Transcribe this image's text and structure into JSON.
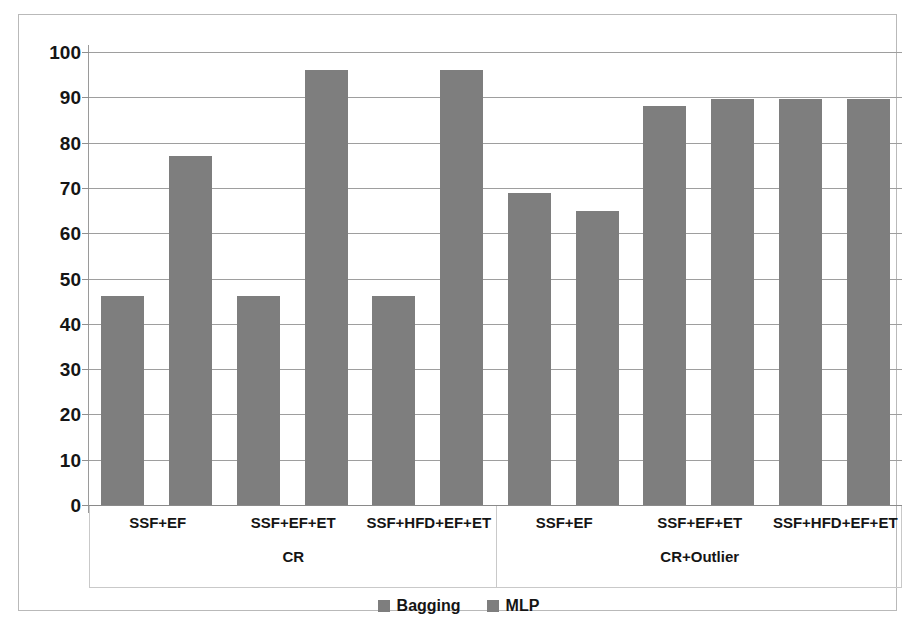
{
  "chart_data": {
    "type": "bar",
    "title": "",
    "xlabel": "",
    "ylabel": "",
    "ylim": [
      0,
      100
    ],
    "yticks": [
      0,
      10,
      20,
      30,
      40,
      50,
      60,
      70,
      80,
      90,
      100
    ],
    "grid": true,
    "legend_position": "bottom",
    "categories": [
      "SSF+EF",
      "SSF+EF+ET",
      "SSF+HFD+EF+ET"
    ],
    "groups": [
      "CR",
      "CR+Outlier"
    ],
    "series": [
      {
        "name": "Bagging",
        "color": "#7e7e7e"
      },
      {
        "name": "MLP",
        "color": "#7e7e7e"
      }
    ],
    "bars": [
      {
        "group": "CR",
        "category": "SSF+EF",
        "series": "Bagging",
        "value": 46.2
      },
      {
        "group": "CR",
        "category": "SSF+EF",
        "series": "MLP",
        "value": 77.0
      },
      {
        "group": "CR",
        "category": "SSF+EF+ET",
        "series": "Bagging",
        "value": 46.2
      },
      {
        "group": "CR",
        "category": "SSF+EF+ET",
        "series": "MLP",
        "value": 96.0
      },
      {
        "group": "CR",
        "category": "SSF+HFD+EF+ET",
        "series": "Bagging",
        "value": 46.2
      },
      {
        "group": "CR",
        "category": "SSF+HFD+EF+ET",
        "series": "MLP",
        "value": 96.0
      },
      {
        "group": "CR+Outlier",
        "category": "SSF+EF",
        "series": "Bagging",
        "value": 68.8
      },
      {
        "group": "CR+Outlier",
        "category": "SSF+EF",
        "series": "MLP",
        "value": 65.0
      },
      {
        "group": "CR+Outlier",
        "category": "SSF+EF+ET",
        "series": "Bagging",
        "value": 88.0
      },
      {
        "group": "CR+Outlier",
        "category": "SSF+EF+ET",
        "series": "MLP",
        "value": 89.7
      },
      {
        "group": "CR+Outlier",
        "category": "SSF+HFD+EF+ET",
        "series": "Bagging",
        "value": 89.7
      },
      {
        "group": "CR+Outlier",
        "category": "SSF+HFD+EF+ET",
        "series": "MLP",
        "value": 89.7
      }
    ]
  },
  "axis": {
    "ticks": [
      "100",
      "90",
      "80",
      "70",
      "60",
      "50",
      "40",
      "30",
      "20",
      "10",
      "0"
    ]
  },
  "categories": {
    "cr": [
      "SSF+EF",
      "SSF+EF+ET",
      "SSF+HFD+EF+ET"
    ],
    "outlier": [
      "SSF+EF",
      "SSF+EF+ET",
      "SSF+HFD+EF+ET"
    ]
  },
  "groups": {
    "left": "CR",
    "right": "CR+Outlier"
  },
  "legend": {
    "items": [
      {
        "label": "Bagging",
        "color": "#7e7e7e"
      },
      {
        "label": "MLP",
        "color": "#7e7e7e"
      }
    ]
  }
}
